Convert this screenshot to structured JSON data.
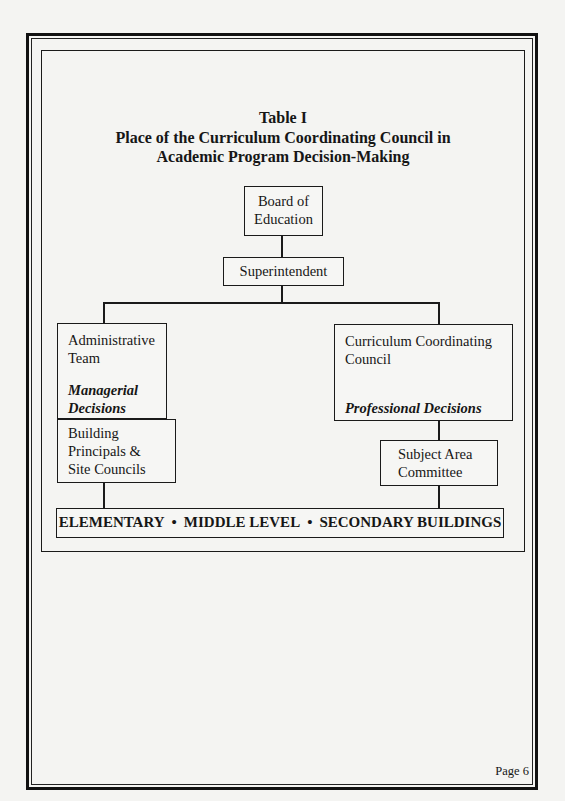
{
  "page": {
    "header_mark": "·· ·· ·",
    "page_number": "Page 6"
  },
  "title": {
    "line1": "Table I",
    "line2": "Place of the Curriculum Coordinating Council in",
    "line3": "Academic Program Decision-Making"
  },
  "org_chart": {
    "board": {
      "line1": "Board of",
      "line2": "Education"
    },
    "superintendent": {
      "label": "Superintendent"
    },
    "administrative_team": {
      "line1": "Administrative",
      "line2": "Team",
      "decision_line1": "Managerial",
      "decision_line2": "Decisions"
    },
    "curriculum_council": {
      "line1": "Curriculum Coordinating",
      "line2": "Council",
      "decision": "Professional Decisions"
    },
    "building_principals": {
      "line1": "Building",
      "line2": "Principals &",
      "line3": "Site Councils"
    },
    "subject_area": {
      "line1": "Subject Area",
      "line2": "Committee"
    },
    "buildings": {
      "item1": "ELEMENTARY",
      "item2": "MIDDLE LEVEL",
      "item3": "SECONDARY BUILDINGS",
      "separator": "•"
    }
  }
}
